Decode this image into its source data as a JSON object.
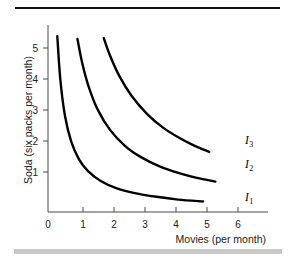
{
  "figure": {
    "background_color": "#ffffff",
    "top_rule_color": "#111111",
    "bottom_bar_color": "#c9c9c9"
  },
  "chart_data": {
    "type": "line",
    "title": "",
    "subtitle": "",
    "xlabel": "Movies (per month)",
    "ylabel": "Soda (six packs per month)",
    "xlim": [
      0,
      6.4
    ],
    "ylim": [
      0,
      5.9
    ],
    "xticks": [
      0,
      1,
      2,
      3,
      4,
      5,
      6
    ],
    "xticklabels": [
      "0",
      "1",
      "2",
      "3",
      "4",
      "5",
      "6"
    ],
    "yticks": [
      1,
      2,
      3,
      4,
      5
    ],
    "yticklabels": [
      "1",
      "2",
      "3",
      "4",
      "5"
    ],
    "origin_label": "0",
    "grid": false,
    "legend": "inline-right-end-labels",
    "annotations": [
      {
        "text": "I",
        "subscript": "3",
        "x": 5.95,
        "y": 2.25
      },
      {
        "text": "I",
        "subscript": "2",
        "x": 5.95,
        "y": 1.48
      },
      {
        "text": "I",
        "subscript": "1",
        "x": 5.95,
        "y": 0.55
      }
    ],
    "series": [
      {
        "name": "I1",
        "label": "I₁",
        "color": "#000000",
        "description": "lowest indifference curve, xy = 1.7",
        "x": [
          0.3,
          0.4,
          0.55,
          0.75,
          1.0,
          1.3,
          1.7,
          2.2,
          2.8,
          3.5,
          4.2,
          5.0,
          5.45
        ],
        "y": [
          5.67,
          4.25,
          3.09,
          2.27,
          1.7,
          1.31,
          1.0,
          0.77,
          0.61,
          0.49,
          0.4,
          0.34,
          0.5
        ]
      },
      {
        "name": "I2",
        "label": "I₂",
        "color": "#000000",
        "description": "middle indifference curve, xy = 5.3",
        "x": [
          0.95,
          1.1,
          1.3,
          1.6,
          2.0,
          2.5,
          3.0,
          3.6,
          4.2,
          4.8,
          5.4,
          5.7
        ],
        "y": [
          5.58,
          4.82,
          4.08,
          3.31,
          2.65,
          2.12,
          1.77,
          1.47,
          1.26,
          1.1,
          0.98,
          1.45
        ]
      },
      {
        "name": "I3",
        "label": "I₃",
        "color": "#000000",
        "description": "highest indifference curve, xy = 10.1",
        "x": [
          1.8,
          2.0,
          2.3,
          2.7,
          3.2,
          3.7,
          4.2,
          4.7,
          5.2,
          5.8
        ],
        "y": [
          5.61,
          5.05,
          4.39,
          3.74,
          3.16,
          2.73,
          2.41,
          2.15,
          1.94,
          2.22
        ]
      }
    ]
  },
  "axis": {
    "y_axis_name": "y-axis",
    "x_axis_name": "x-axis"
  }
}
